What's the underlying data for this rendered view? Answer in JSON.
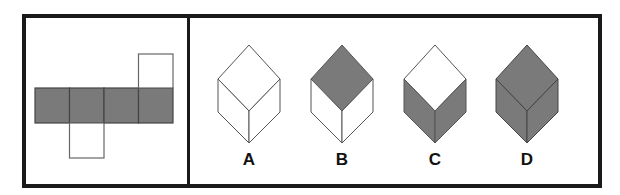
{
  "puzzle": {
    "net": {
      "shaded_color": "#7a7a7a",
      "line_color": "#444444",
      "squares": [
        {
          "x": 35,
          "y": 88,
          "shaded": true
        },
        {
          "x": 69.5,
          "y": 88,
          "shaded": true
        },
        {
          "x": 104,
          "y": 88,
          "shaded": true
        },
        {
          "x": 138.5,
          "y": 88,
          "shaded": true
        },
        {
          "x": 138.5,
          "y": 54,
          "shaded": false
        },
        {
          "x": 69.5,
          "y": 122,
          "shaded": false
        }
      ],
      "square_size": 34.5
    },
    "options": [
      {
        "label": "A",
        "top": "white",
        "left": "white",
        "right": "white"
      },
      {
        "label": "B",
        "top": "gray",
        "left": "white",
        "right": "white"
      },
      {
        "label": "C",
        "top": "white",
        "left": "gray",
        "right": "gray"
      },
      {
        "label": "D",
        "top": "gray",
        "left": "gray",
        "right": "gray"
      }
    ]
  }
}
